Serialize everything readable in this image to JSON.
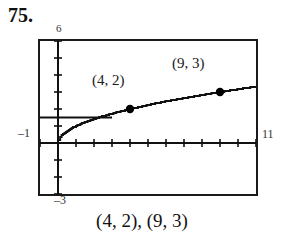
{
  "problem": {
    "number": "75."
  },
  "caption": "(4, 2), (9, 3)",
  "axis_labels": {
    "top": "6",
    "left": "–1",
    "right": "11",
    "bottom": "–3"
  },
  "annotations": {
    "point_a": "(4, 2)",
    "point_b": "(9, 3)"
  },
  "colors": {
    "frame": "#1a1a1a",
    "axis": "#111111",
    "curve": "#111111",
    "point": "#000000",
    "background": "#ffffff"
  },
  "chart_data": {
    "type": "line",
    "title": "",
    "subtitle": "",
    "xlabel": "",
    "ylabel": "",
    "xlim": [
      -1,
      11
    ],
    "ylim": [
      -3,
      6
    ],
    "grid": false,
    "legend": false,
    "x_tick_step": 1,
    "y_tick_step": 1,
    "viewport_note": "Graphing calculator window: Xmin=-1, Xmax=11, Ymin=-3, Ymax=6",
    "series": [
      {
        "name": "y = sqrt(x)",
        "style": "stair-stepped curve",
        "x": [
          0,
          0.25,
          0.5,
          1,
          1.5,
          2,
          2.5,
          3,
          3.5,
          4,
          5,
          6,
          7,
          8,
          9,
          10,
          11
        ],
        "y": [
          0,
          0.5,
          0.71,
          1,
          1.22,
          1.41,
          1.58,
          1.73,
          1.87,
          2,
          2.24,
          2.45,
          2.65,
          2.83,
          3,
          3.16,
          3.32
        ]
      },
      {
        "name": "y = 1.5 (horizontal segment)",
        "style": "horizontal line",
        "x": [
          -1,
          3
        ],
        "y": [
          1.5,
          1.5
        ]
      }
    ],
    "points": [
      {
        "label": "(4, 2)",
        "x": 4,
        "y": 2
      },
      {
        "label": "(9, 3)",
        "x": 9,
        "y": 3
      }
    ],
    "annotations": [
      {
        "text": "(4, 2)",
        "x": 3.0,
        "y": 3.4
      },
      {
        "text": "(9, 3)",
        "x": 7.6,
        "y": 4.3
      }
    ]
  }
}
